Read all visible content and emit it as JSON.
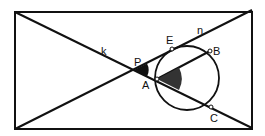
{
  "diagram": {
    "labels": {
      "k": "k",
      "n": "n",
      "P": "P",
      "A": "A",
      "E": "E",
      "B": "B",
      "C": "C"
    },
    "colors": {
      "stroke": "#111111",
      "shade_P": "#111111",
      "shade_A": "#333333",
      "point_fill": "#ffffff",
      "background": "#ffffff"
    },
    "elements": {
      "rectangle": "bounding rectangle with two diagonals",
      "line_k": "diagonal from top-left to bottom-right through P, A, C",
      "line_n": "diagonal from bottom-left to top-right through P, E",
      "segment_AB": "chord from A to B",
      "circle": "circle through A, E, B, C"
    }
  }
}
